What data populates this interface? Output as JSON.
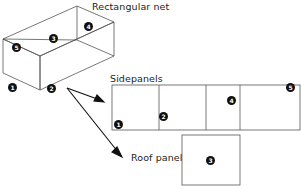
{
  "figure": {
    "type": "geometry-net-diagram",
    "background_color": "#ffffff",
    "line_color": "#555555",
    "marker_fill": "#101010",
    "marker_text_color": "#ffffff",
    "text_color": "#1c1c1c"
  },
  "labels": {
    "rectangular_net": "Rectangular net",
    "sidepanels": "Sidepanels",
    "roof_panel": "Roof panel"
  },
  "box_markers": [
    {
      "id": "box-face-5",
      "number": "5",
      "x": 12,
      "y": 43
    },
    {
      "id": "box-face-3",
      "number": "3",
      "x": 49,
      "y": 34
    },
    {
      "id": "box-face-4",
      "number": "4",
      "x": 84,
      "y": 22
    },
    {
      "id": "box-face-1",
      "number": "1",
      "x": 8,
      "y": 83
    },
    {
      "id": "box-face-2",
      "number": "2",
      "x": 47,
      "y": 84
    }
  ],
  "sidepanel_markers": [
    {
      "id": "sidepanel-1",
      "number": "1",
      "x": 114,
      "y": 120
    },
    {
      "id": "sidepanel-2",
      "number": "2",
      "x": 159,
      "y": 112
    },
    {
      "id": "sidepanel-4",
      "number": "4",
      "x": 227,
      "y": 96
    },
    {
      "id": "sidepanel-5",
      "number": "5",
      "x": 286,
      "y": 83
    }
  ],
  "roofpanel_markers": [
    {
      "id": "roofpanel-3",
      "number": "3",
      "x": 206,
      "y": 156
    }
  ]
}
